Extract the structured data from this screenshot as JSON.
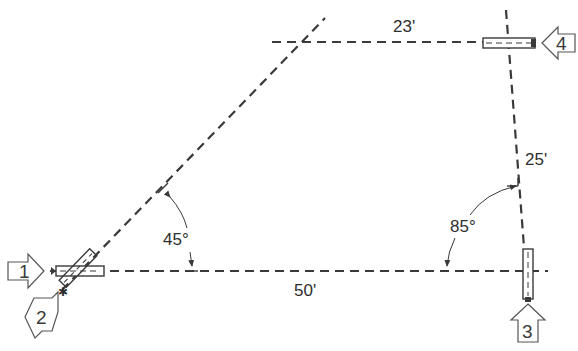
{
  "diagram": {
    "type": "surveying/traverse layout diagram",
    "dimensions": {
      "top_segment": "23'",
      "right_segment": "25'",
      "bottom_segment": "50'"
    },
    "angles": {
      "left_angle": "45°",
      "right_angle": "85°"
    },
    "stations": [
      {
        "id": "1",
        "label": "1",
        "pointing": "right"
      },
      {
        "id": "2",
        "label": "2",
        "pointing": "up-right"
      },
      {
        "id": "3",
        "label": "3",
        "pointing": "up"
      },
      {
        "id": "4",
        "label": "4",
        "pointing": "left"
      }
    ],
    "colors": {
      "line": "#3a3a3a",
      "background": "#ffffff"
    }
  }
}
